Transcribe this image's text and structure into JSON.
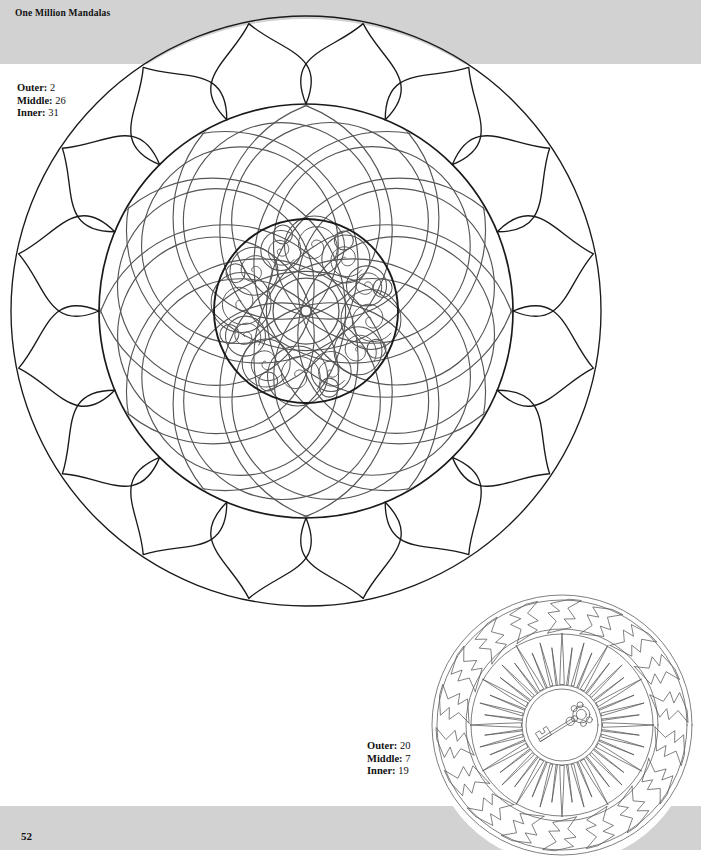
{
  "header": {
    "title": "One Million Mandalas"
  },
  "footer": {
    "page_number": "52"
  },
  "legends": {
    "main": {
      "outer_label": "Outer:",
      "outer_value": "2",
      "middle_label": "Middle:",
      "middle_value": "26",
      "inner_label": "Inner:",
      "inner_value": "31"
    },
    "thumb": {
      "outer_label": "Outer:",
      "outer_value": "20",
      "middle_label": "Middle:",
      "middle_value": "7",
      "inner_label": "Inner:",
      "inner_value": "19"
    }
  },
  "colors": {
    "band": "#d2d2d2",
    "page": "#ffffff",
    "ink": "#1a1a1a",
    "ink_light": "#555555",
    "text": "#111111"
  },
  "main_mandala": {
    "name": "lotus-swirl-spiral-mandala",
    "center": [
      306,
      311
    ],
    "outer_radius": 295,
    "rings": [
      {
        "name": "outer-lotus-petals",
        "style": "pointed ogee lotus petals",
        "petal_count": 16,
        "inner_radius": 207,
        "outer_radius": 295
      },
      {
        "name": "middle-swirl-crescents",
        "style": "overlapping crescent swirl arms",
        "arm_count": 12,
        "inner_radius": 92,
        "outer_radius": 207
      },
      {
        "name": "inner-spiral-disc",
        "style": "ring of spirals in circles with small filler circles",
        "spiral_count": 12,
        "filler_count": 8,
        "radius": 92,
        "core_radius": 33
      }
    ]
  },
  "thumb_mandala": {
    "name": "key-sunburst-wave-mandala",
    "center": [
      562,
      725
    ],
    "outer_radius": 130,
    "rings": [
      {
        "name": "outer-wave-band",
        "style": "zigzag wave ribbons",
        "count": 18,
        "inner_radius": 96,
        "outer_radius": 130
      },
      {
        "name": "middle-sunburst",
        "style": "spiky radiating rays",
        "count": 48,
        "inner_radius": 40,
        "outer_radius": 92
      },
      {
        "name": "inner-key-medallion",
        "style": "double circle with ornamental key",
        "radius": 40,
        "motif": "key"
      }
    ]
  }
}
